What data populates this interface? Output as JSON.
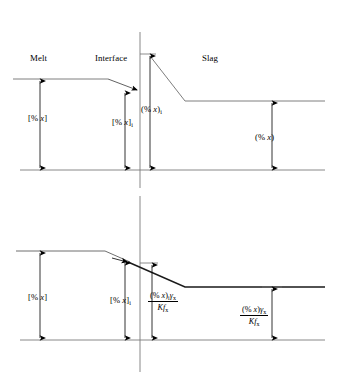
{
  "figure": {
    "ink_color": "#000000",
    "profile_color": "#6f6f6f"
  },
  "top_panel": {
    "regions": {
      "melt": "Melt",
      "interface": "Interface",
      "slag": "Slag"
    },
    "measures": {
      "bulk_melt": {
        "text": "[% x]",
        "var": "x"
      },
      "interface_melt": {
        "text": "[% x]i",
        "var": "x",
        "sub": "i"
      },
      "interface_slag": {
        "text": "(% x)i",
        "var": "x",
        "sub": "i"
      },
      "bulk_slag": {
        "text": "(% x)",
        "var": "x"
      }
    }
  },
  "bottom_panel": {
    "measures": {
      "bulk_melt": {
        "text": "[% x]",
        "var": "x"
      },
      "interface_melt": {
        "text": "[% x]i",
        "var": "x",
        "sub": "i"
      }
    },
    "fractions": {
      "interface_activity": {
        "numerator": "(% x)i γx",
        "denominator": "Kfx"
      },
      "bulk_activity": {
        "numerator": "(% x)γx",
        "denominator": "Kfx"
      }
    }
  },
  "symbols": {
    "percent": "%",
    "gamma": "γ",
    "K": "K",
    "f": "f",
    "x": "x",
    "sub_i": "i",
    "sub_x": "x"
  }
}
